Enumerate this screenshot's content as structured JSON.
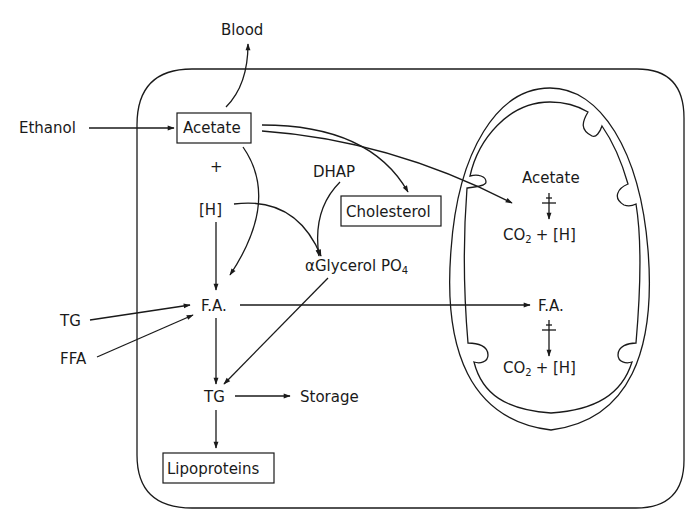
{
  "diagram": {
    "nodes": {
      "blood": "Blood",
      "ethanol": "Ethanol",
      "acetate": "Acetate",
      "plus": "+",
      "h": "[H]",
      "dhap": "DHAP",
      "cholesterol": "Cholesterol",
      "glycerol_alpha": "α",
      "glycerol": "Glycerol PO",
      "glycerol_sub": "4",
      "fa": "F.A.",
      "tg_in": "TG",
      "ffa": "FFA",
      "tg": "TG",
      "storage": "Storage",
      "lipoproteins": "Lipoproteins",
      "mito_acetate": "Acetate",
      "mito_co2_top": "CO",
      "mito_co2_top_sub": "2",
      "mito_plus_h_top": "+ [H]",
      "mito_fa": "F.A.",
      "mito_co2_bot": "CO",
      "mito_co2_bot_sub": "2",
      "mito_plus_h_bot": "+ [H]"
    },
    "edges": [
      {
        "from": "Ethanol",
        "to": "Acetate"
      },
      {
        "from": "Acetate",
        "to": "Blood"
      },
      {
        "from": "Acetate",
        "to": "Cholesterol"
      },
      {
        "from": "Acetate",
        "to": "Mitochondrial Acetate"
      },
      {
        "from": "Acetate",
        "to": "F.A."
      },
      {
        "from": "[H]",
        "to": "F.A."
      },
      {
        "from": "[H]",
        "to": "αGlycerol PO4"
      },
      {
        "from": "DHAP",
        "to": "αGlycerol PO4"
      },
      {
        "from": "αGlycerol PO4",
        "to": "TG"
      },
      {
        "from": "TG (external)",
        "to": "F.A."
      },
      {
        "from": "FFA",
        "to": "F.A."
      },
      {
        "from": "F.A.",
        "to": "Mitochondrial F.A."
      },
      {
        "from": "F.A.",
        "to": "TG"
      },
      {
        "from": "TG",
        "to": "Storage"
      },
      {
        "from": "TG",
        "to": "Lipoproteins"
      },
      {
        "from": "Mitochondrial Acetate",
        "to": "CO2 + [H]"
      },
      {
        "from": "Mitochondrial F.A.",
        "to": "CO2 + [H]"
      }
    ]
  }
}
